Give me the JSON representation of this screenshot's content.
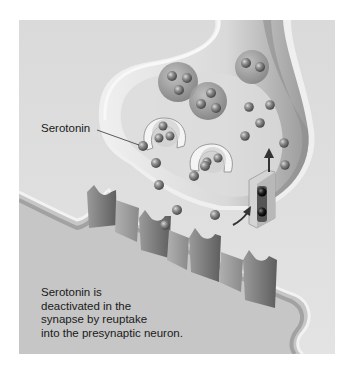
{
  "figure": {
    "labels": {
      "neurotransmitter": "Serotonin"
    },
    "caption": {
      "lines": [
        "Serotonin is",
        "deactivated in the",
        "synapse by reuptake",
        "into the presynaptic neuron."
      ]
    },
    "colors": {
      "background": "#dcdcdc",
      "postsynaptic_fill": "#c9c9c9",
      "presynaptic_fill": "#e6e6e6",
      "membrane": "#f5f5f5",
      "receptor": "#7a7a7a",
      "molecule": "#8a8a8a",
      "transporter_molecule": "#1e1e1e",
      "text": "#1a1a1a"
    }
  }
}
